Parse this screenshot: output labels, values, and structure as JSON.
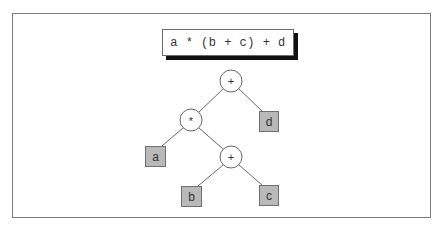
{
  "expression": {
    "text": "a * (b + c) + d"
  },
  "tree": {
    "nodes": [
      {
        "id": "root-plus",
        "kind": "operator",
        "label": "+",
        "cx": 231,
        "cy": 81,
        "r": 11
      },
      {
        "id": "times",
        "kind": "operator",
        "label": "*",
        "cx": 191,
        "cy": 120,
        "r": 11
      },
      {
        "id": "inner-plus",
        "kind": "operator",
        "label": "+",
        "cx": 231,
        "cy": 157,
        "r": 11
      },
      {
        "id": "leaf-d",
        "kind": "operand",
        "label": "d",
        "x": 259,
        "y": 111,
        "w": 19,
        "h": 20
      },
      {
        "id": "leaf-a",
        "kind": "operand",
        "label": "a",
        "x": 145,
        "y": 146,
        "w": 20,
        "h": 20
      },
      {
        "id": "leaf-b",
        "kind": "operand",
        "label": "b",
        "x": 181,
        "y": 186,
        "w": 20,
        "h": 20
      },
      {
        "id": "leaf-c",
        "kind": "operand",
        "label": "c",
        "x": 259,
        "y": 185,
        "w": 19,
        "h": 20
      }
    ],
    "edges": [
      {
        "from": "root-plus",
        "to": "times"
      },
      {
        "from": "root-plus",
        "to": "leaf-d"
      },
      {
        "from": "times",
        "to": "leaf-a"
      },
      {
        "from": "times",
        "to": "inner-plus"
      },
      {
        "from": "inner-plus",
        "to": "leaf-b"
      },
      {
        "from": "inner-plus",
        "to": "leaf-c"
      }
    ]
  },
  "colors": {
    "leaf_fill": "#b9b9b9",
    "leaf_border": "#6f6f6f",
    "line": "#666666",
    "shadow": "#111111",
    "frame": "#7a7a7a"
  }
}
